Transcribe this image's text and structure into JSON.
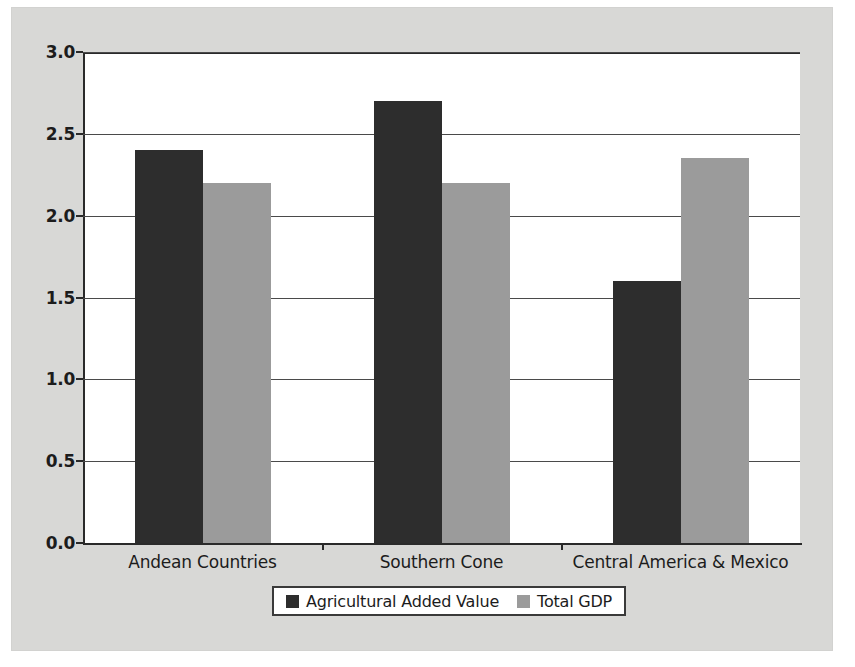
{
  "chart_data": {
    "type": "bar",
    "title": "",
    "subtitle": "",
    "xlabel": "",
    "ylabel": "",
    "categories": [
      "Andean Countries",
      "Southern Cone",
      "Central America & Mexico"
    ],
    "series": [
      {
        "name": "Agricultural Added Value",
        "color": "#2d2d2d",
        "values": [
          2.4,
          2.7,
          1.6
        ]
      },
      {
        "name": "Total GDP",
        "color": "#9b9b9b",
        "values": [
          2.2,
          2.2,
          2.35
        ]
      }
    ],
    "ylim": [
      0.0,
      3.0
    ],
    "ytick_values": [
      0.0,
      0.5,
      1.0,
      1.5,
      2.0,
      2.5,
      3.0
    ],
    "ytick_labels": [
      "0.0",
      "0.5",
      "1.0",
      "1.5",
      "2.0",
      "2.5",
      "3.0"
    ],
    "grid": true,
    "grid_axis": "y",
    "legend_position": "bottom",
    "plot_background": "#ffffff",
    "figure_background": "#d8d8d6",
    "axis_color": "#2a2a2a"
  }
}
